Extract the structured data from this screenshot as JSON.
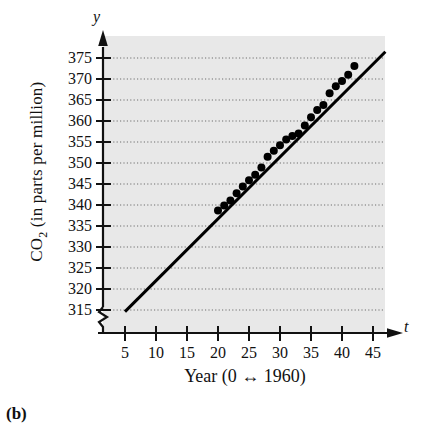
{
  "figure": {
    "caption": "(b)",
    "axis_letter_y": "y",
    "axis_letter_t": "t"
  },
  "chart_data": {
    "type": "scatter",
    "title": "",
    "subtitle": "",
    "xlabel": "Year (0 ↔ 1960)",
    "ylabel": "CO2 (in parts per million)",
    "ylabel_prefix": "CO",
    "ylabel_subscript": "2",
    "ylabel_suffix": " (in parts per million)",
    "axis_variable_x": "t",
    "axis_variable_y": "y",
    "xlim": [
      2,
      47
    ],
    "ylim": [
      313,
      377
    ],
    "xticks": [
      5,
      10,
      15,
      20,
      25,
      30,
      35,
      40,
      45
    ],
    "yticks": [
      315,
      320,
      325,
      330,
      335,
      340,
      345,
      350,
      355,
      360,
      365,
      370,
      375
    ],
    "grid": "horizontal-dotted",
    "y_axis_break": true,
    "legend": "none",
    "background_color": "#e8e8e8",
    "series": [
      {
        "name": "CO2 concentration (Mauna Loa)",
        "type": "scatter",
        "marker": "filled-circle",
        "color": "#000000",
        "x": [
          20,
          21,
          22,
          23,
          24,
          25,
          26,
          27,
          28,
          29,
          30,
          31,
          32,
          33,
          34,
          35,
          36,
          37,
          38,
          39,
          40,
          41,
          42
        ],
        "y": [
          338.7,
          339.9,
          341.1,
          342.8,
          344.4,
          345.9,
          347.2,
          348.9,
          351.5,
          352.9,
          354.2,
          355.6,
          356.4,
          357.0,
          358.9,
          360.9,
          362.6,
          363.8,
          366.6,
          368.3,
          369.5,
          371.0,
          373.1
        ]
      },
      {
        "name": "regression line",
        "type": "line",
        "color": "#000000",
        "x": [
          5,
          47
        ],
        "y": [
          314.6,
          376.5
        ]
      }
    ]
  }
}
